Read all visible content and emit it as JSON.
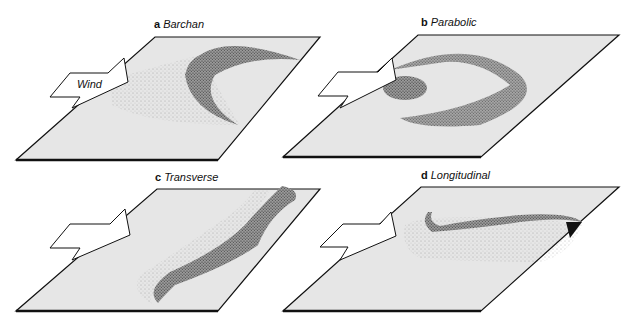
{
  "figure": {
    "panels": [
      {
        "letter": "a",
        "name": "Barchan"
      },
      {
        "letter": "b",
        "name": "Parabolic"
      },
      {
        "letter": "c",
        "name": "Transverse"
      },
      {
        "letter": "d",
        "name": "Longitudinal"
      }
    ],
    "wind_label": "Wind"
  },
  "colors": {
    "plane_fill": "#e6e6e6",
    "outline": "#111111",
    "dune_shade": "#8a8a8a",
    "background": "#ffffff"
  }
}
